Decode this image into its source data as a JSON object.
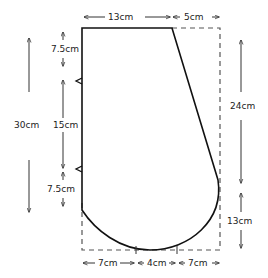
{
  "diagram": {
    "type": "sewing pattern piece",
    "units": "cm",
    "shape": {
      "top_edge": "13cm",
      "top_extension_dashed": "5cm",
      "left_edge_sections": [
        "7.5cm",
        "15cm",
        "7.5cm"
      ],
      "left_total": "30cm",
      "right_upper": "24cm",
      "right_lower": "13cm",
      "bottom_sections": [
        "7cm",
        "4cm",
        "7cm"
      ],
      "notches": 2
    },
    "labels": {
      "top_left": "13cm",
      "top_right": "5cm",
      "left_total": "30cm",
      "left_top": "7.5cm",
      "left_mid": "15cm",
      "left_bottom": "7.5cm",
      "right_upper": "24cm",
      "right_lower": "13cm",
      "bottom_left": "7cm",
      "bottom_mid": "4cm",
      "bottom_right": "7cm"
    },
    "colors": {
      "outline": "#111111",
      "dashed": "#555555",
      "arrows": "#333333"
    }
  }
}
